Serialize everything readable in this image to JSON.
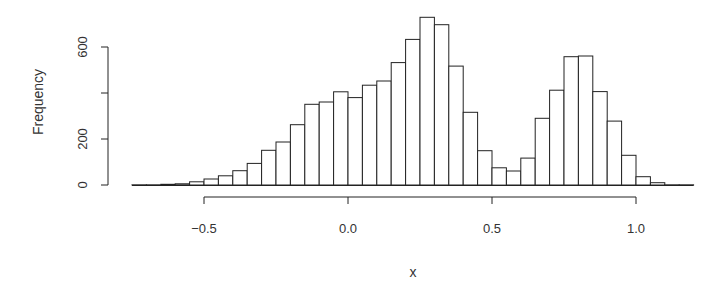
{
  "chart_data": {
    "type": "bar",
    "subtype": "histogram",
    "title": "",
    "xlabel": "x",
    "ylabel": "Frequency",
    "bin_width": 0.05,
    "bin_start": -0.75,
    "bin_end": 1.2,
    "bins": [
      [
        -0.75,
        -0.7
      ],
      [
        -0.7,
        -0.65
      ],
      [
        -0.65,
        -0.6
      ],
      [
        -0.6,
        -0.55
      ],
      [
        -0.55,
        -0.5
      ],
      [
        -0.5,
        -0.45
      ],
      [
        -0.45,
        -0.4
      ],
      [
        -0.4,
        -0.35
      ],
      [
        -0.35,
        -0.3
      ],
      [
        -0.3,
        -0.25
      ],
      [
        -0.25,
        -0.2
      ],
      [
        -0.2,
        -0.15
      ],
      [
        -0.15,
        -0.1
      ],
      [
        -0.1,
        -0.05
      ],
      [
        -0.05,
        0.0
      ],
      [
        0.0,
        0.05
      ],
      [
        0.05,
        0.1
      ],
      [
        0.1,
        0.15
      ],
      [
        0.15,
        0.2
      ],
      [
        0.2,
        0.25
      ],
      [
        0.25,
        0.3
      ],
      [
        0.3,
        0.35
      ],
      [
        0.35,
        0.4
      ],
      [
        0.4,
        0.45
      ],
      [
        0.45,
        0.5
      ],
      [
        0.5,
        0.55
      ],
      [
        0.55,
        0.6
      ],
      [
        0.6,
        0.65
      ],
      [
        0.65,
        0.7
      ],
      [
        0.7,
        0.75
      ],
      [
        0.75,
        0.8
      ],
      [
        0.8,
        0.85
      ],
      [
        0.85,
        0.9
      ],
      [
        0.9,
        0.95
      ],
      [
        0.95,
        1.0
      ],
      [
        1.0,
        1.05
      ],
      [
        1.05,
        1.1
      ],
      [
        1.1,
        1.15
      ],
      [
        1.15,
        1.2
      ]
    ],
    "values": [
      1,
      1,
      3,
      5,
      14,
      26,
      40,
      62,
      94,
      151,
      187,
      262,
      351,
      361,
      405,
      380,
      434,
      452,
      532,
      633,
      729,
      697,
      517,
      316,
      149,
      75,
      61,
      117,
      290,
      412,
      558,
      561,
      406,
      278,
      129,
      36,
      10,
      1,
      1
    ],
    "xlim": [
      -0.75,
      1.2
    ],
    "ylim": [
      0,
      730
    ],
    "x_ticks": [
      -0.5,
      0.0,
      0.5,
      1.0
    ],
    "x_tick_labels": [
      "-0.5",
      "0.0",
      "0.5",
      "1.0"
    ],
    "y_ticks": [
      0,
      200,
      400,
      600
    ],
    "y_tick_labels": [
      "0",
      "200",
      "",
      "600"
    ],
    "grid": false,
    "legend": null,
    "colors": {
      "bar_fill": "#ffffff",
      "bar_stroke": "#222222",
      "text": "#333333"
    }
  }
}
